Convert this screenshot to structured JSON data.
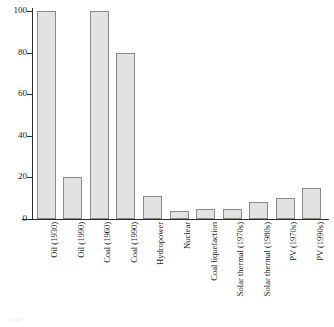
{
  "chart_data": {
    "type": "bar",
    "title": "",
    "subtitle": "",
    "xlabel": "",
    "ylabel": "",
    "ylim": [
      0,
      100
    ],
    "yticks": [
      0,
      20,
      40,
      60,
      80,
      100
    ],
    "ytick_labels": [
      "0",
      "20",
      "40",
      "60",
      "80",
      "100"
    ],
    "grid": false,
    "legend": "none",
    "bar_fill_color": "#e2e2e2",
    "bar_edge_color": "#8a8a8a",
    "axis_color": "#2b2b2b",
    "background_color": "#ffffff",
    "categories": [
      "Oil (1930)",
      "Oil (1990)",
      "Coal (1960)",
      "Coal (1990)",
      "Hydropower",
      "Nuclear",
      "Coal liquefaction",
      "Solar thermal (1970s)",
      "Solar thermal (1980s)",
      "PV (1970s)",
      "PV (1990s)"
    ],
    "values": [
      100,
      20,
      100,
      80,
      11,
      4,
      5,
      5,
      8,
      10,
      15
    ]
  },
  "caption": {
    "fragment": "1990"
  }
}
